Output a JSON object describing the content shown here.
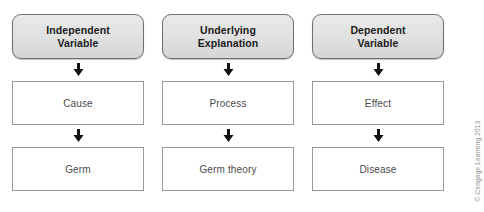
{
  "figure": {
    "top_edge_artifacts": [
      "·",
      "·",
      "·",
      "·"
    ],
    "credit": "© Cengage Learning 2013",
    "arrow_icon_name": "down-arrow-icon",
    "colors": {
      "header_fill_top": "#e9e9e9",
      "header_fill_bottom": "#d6d6d6",
      "header_border": "#6f6f6f",
      "box_border": "#9a9a9a",
      "box_fill": "#ffffff",
      "header_text": "#1b1b1b",
      "box_text": "#4a4a4a",
      "credit_text": "#8c8c8c",
      "page_background": "#ffffff"
    }
  },
  "columns": [
    {
      "header_line1": "Independent",
      "header_line2": "Variable",
      "middle": "Cause",
      "bottom": "Germ"
    },
    {
      "header_line1": "Underlying",
      "header_line2": "Explanation",
      "middle": "Process",
      "bottom": "Germ theory"
    },
    {
      "header_line1": "Dependent",
      "header_line2": "Variable",
      "middle": "Effect",
      "bottom": "Disease"
    }
  ]
}
